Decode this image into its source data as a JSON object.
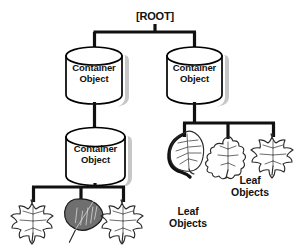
{
  "diagram": {
    "background_color": "#ffffff",
    "line_color": "#111111",
    "text_color": "#111111",
    "cylinder_fill": "#ffffff",
    "cylinder_stroke": "#000000",
    "shadow_color": "#b9b9b9",
    "root": {
      "label": "[ROOT]"
    },
    "containers": [
      {
        "id": "container-top-left",
        "label": "Container\nObject"
      },
      {
        "id": "container-top-right",
        "label": "Container\nObject"
      },
      {
        "id": "container-mid-left",
        "label": "Container\nObject"
      }
    ],
    "leaf_groups": [
      {
        "id": "leaf-group-right",
        "label": "Leaf\nObjects",
        "leaves": [
          {
            "id": "leaf-aspen-dark",
            "shape": "aspen-leaf-icon",
            "emphasis": "dark-outline"
          },
          {
            "id": "leaf-oak",
            "shape": "oak-leaf-icon",
            "emphasis": "thin-outline"
          },
          {
            "id": "leaf-maple-right",
            "shape": "maple-leaf-icon",
            "emphasis": "thin-outline"
          }
        ]
      },
      {
        "id": "leaf-group-bottom",
        "label": "Leaf\nObjects",
        "leaves": [
          {
            "id": "leaf-maple-left",
            "shape": "maple-leaf-icon",
            "emphasis": "thin-outline"
          },
          {
            "id": "leaf-birch-dark",
            "shape": "birch-leaf-icon",
            "emphasis": "shaded-fill"
          },
          {
            "id": "leaf-maple-mid",
            "shape": "maple-leaf-icon",
            "emphasis": "thin-outline"
          }
        ]
      }
    ]
  }
}
